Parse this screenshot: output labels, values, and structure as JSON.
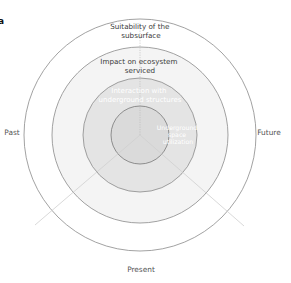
{
  "panel_label": "a",
  "colors": {
    "ring_stroke": "#8a8a8a",
    "outer_ring_fill": "#ffffff",
    "second_ring_fill": "#f4f4f4",
    "third_ring_fill": "#e6e6e6",
    "core_fill": "#dcdcdc",
    "radial_line": "#c8c8c8"
  },
  "rings": [
    {
      "id": "outer",
      "label_lines": [
        "Suitability of the",
        "subsurface"
      ]
    },
    {
      "id": "second",
      "label_lines": [
        "Impact on ecosystem",
        "serviced"
      ]
    },
    {
      "id": "third",
      "label_lines": [
        "Interaction with",
        "underground structures"
      ]
    },
    {
      "id": "core",
      "label_lines": [
        "Underground",
        "space",
        "utilization"
      ]
    }
  ],
  "time_axes": {
    "left": "Past",
    "right": "Future",
    "bottom": "Present"
  }
}
